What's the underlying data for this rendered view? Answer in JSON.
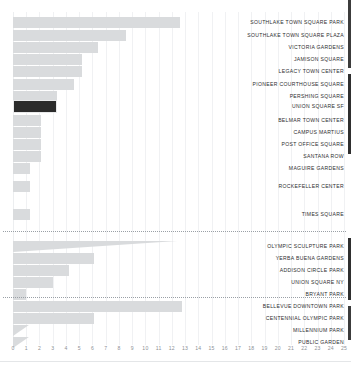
{
  "chart_data": {
    "type": "bar",
    "orientation": "horizontal",
    "title": "",
    "xlabel": "",
    "ylabel": "",
    "xlim": [
      0,
      25
    ],
    "grid": true,
    "legend": "none",
    "tick_labels": [
      "0",
      "1",
      "2",
      "3",
      "4",
      "5",
      "6",
      "7",
      "8",
      "9",
      "10",
      "11",
      "12",
      "13",
      "14",
      "15",
      "16",
      "17",
      "18",
      "19",
      "20",
      "21",
      "22",
      "23",
      "24",
      "25"
    ],
    "highlight_color": "#2b2b2b",
    "bar_color": "#d9dbdd",
    "highlighted_category": "UNION SQUARE SF",
    "categories": [
      "SOUTHLAKE TOWN SQUARE PARK",
      "SOUTHLAKE TOWN SQUARE PLAZA",
      "VICTORIA GARDENS",
      "JAMISON SQUARE",
      "LEGACY TOWN CENTER",
      "PIONEER COURTHOUSE SQUARE",
      "PERSHING SQUARE",
      "UNION SQUARE SF",
      "BELMAR TOWN CENTER",
      "CAMPUS MARTIUS",
      "POST OFFICE SQUARE",
      "SANTANA ROW",
      "MAGUIRE GARDENS",
      "ROCKEFELLER CENTER",
      "TIMES SQUARE",
      "OLYMPIC SCULPTURE PARK",
      "YERBA BUENA GARDENS",
      "ADDISON CIRCLE PARK",
      "UNION SQUARE NY",
      "BRYANT PARK",
      "BELLEVUE DOWNTOWN PARK",
      "CENTENNIAL OLYMPIC PARK",
      "MILLENNIUM PARK",
      "PUBLIC GARDEN"
    ],
    "values": [
      12.6,
      8.5,
      6.4,
      5.2,
      5.2,
      4.6,
      3.3,
      3.3,
      2.1,
      2.1,
      2.1,
      2.1,
      1.3,
      1.3,
      1.3,
      12.4,
      6.1,
      4.2,
      3.0,
      1.0,
      12.8,
      6.1,
      1.2,
      1.2
    ],
    "rows": [
      {
        "label": "SOUTHLAKE TOWN SQUARE PARK",
        "value": 12.6,
        "y": 16,
        "highlight": false,
        "taper": false
      },
      {
        "label": "SOUTHLAKE TOWN SQUARE PLAZA",
        "value": 8.5,
        "y": 29,
        "highlight": false,
        "taper": false
      },
      {
        "label": "VICTORIA GARDENS",
        "value": 6.4,
        "y": 41,
        "highlight": false,
        "taper": false
      },
      {
        "label": "JAMISON SQUARE",
        "value": 5.2,
        "y": 53,
        "highlight": false,
        "taper": false
      },
      {
        "label": "LEGACY TOWN CENTER",
        "value": 5.2,
        "y": 65,
        "highlight": false,
        "taper": false
      },
      {
        "label": "PIONEER COURTHOUSE SQUARE",
        "value": 4.6,
        "y": 78,
        "highlight": false,
        "taper": false
      },
      {
        "label": "PERSHING SQUARE",
        "value": 3.3,
        "y": 90,
        "highlight": false,
        "taper": false
      },
      {
        "label": "UNION SQUARE SF",
        "value": 3.3,
        "y": 100,
        "highlight": true,
        "taper": false
      },
      {
        "label": "BELMAR TOWN CENTER",
        "value": 2.1,
        "y": 114,
        "highlight": false,
        "taper": false
      },
      {
        "label": "CAMPUS MARTIUS",
        "value": 2.1,
        "y": 126,
        "highlight": false,
        "taper": false
      },
      {
        "label": "POST OFFICE SQUARE",
        "value": 2.1,
        "y": 138,
        "highlight": false,
        "taper": false
      },
      {
        "label": "SANTANA ROW",
        "value": 2.1,
        "y": 150,
        "highlight": false,
        "taper": false
      },
      {
        "label": "MAGUIRE GARDENS",
        "value": 1.3,
        "y": 162,
        "highlight": false,
        "taper": false
      },
      {
        "label": "ROCKEFELLER CENTER",
        "value": 1.3,
        "y": 180,
        "highlight": false,
        "taper": false
      },
      {
        "label": "TIMES SQUARE",
        "value": 1.3,
        "y": 208,
        "highlight": false,
        "taper": false
      },
      {
        "label": "OLYMPIC SCULPTURE PARK",
        "value": 12.4,
        "y": 240,
        "highlight": false,
        "taper": true
      },
      {
        "label": "YERBA BUENA GARDENS",
        "value": 6.1,
        "y": 252,
        "highlight": false,
        "taper": false
      },
      {
        "label": "ADDISON CIRCLE PARK",
        "value": 4.2,
        "y": 264,
        "highlight": false,
        "taper": false
      },
      {
        "label": "UNION SQUARE NY",
        "value": 3.0,
        "y": 276,
        "highlight": false,
        "taper": false
      },
      {
        "label": "BRYANT PARK",
        "value": 1.0,
        "y": 288,
        "highlight": false,
        "taper": false
      },
      {
        "label": "BELLEVUE DOWNTOWN PARK",
        "value": 12.8,
        "y": 300,
        "highlight": false,
        "taper": false
      },
      {
        "label": "CENTENNIAL OLYMPIC PARK",
        "value": 6.1,
        "y": 312,
        "highlight": false,
        "taper": false
      },
      {
        "label": "MILLENNIUM PARK",
        "value": 1.2,
        "y": 324,
        "highlight": false,
        "taper": true
      },
      {
        "label": "PUBLIC GARDEN",
        "value": 1.2,
        "y": 336,
        "highlight": false,
        "taper": true
      }
    ],
    "separators": [
      {
        "name": "separator-after-times-square",
        "y": 231
      },
      {
        "name": "separator-after-bryant-park",
        "y": 297
      }
    ]
  }
}
